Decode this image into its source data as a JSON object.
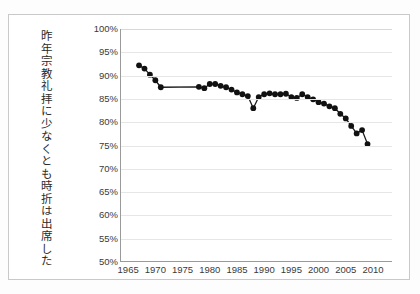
{
  "chart_data": {
    "type": "line",
    "title": "",
    "subtitle": "",
    "xlabel": "",
    "ylabel": "昨年宗教礼拝に少なくとも時折は出席した",
    "xlim": [
      1963.5,
      2013.5
    ],
    "ylim": [
      50,
      100
    ],
    "grid": true,
    "legend": false,
    "marker": "filled-circle",
    "line_color": "#1a1a1a",
    "marker_color": "#111111",
    "ytick_labels": [
      "100%",
      "95%",
      "90%",
      "85%",
      "80%",
      "75%",
      "70%",
      "65%",
      "60%",
      "55%",
      "50%"
    ],
    "ytick_values": [
      100,
      95,
      90,
      85,
      80,
      75,
      70,
      65,
      60,
      55,
      50
    ],
    "xtick_labels": [
      "1965",
      "1970",
      "1975",
      "1980",
      "1985",
      "1990",
      "1995",
      "2000",
      "2005",
      "2010"
    ],
    "xtick_values": [
      1965,
      1970,
      1975,
      1980,
      1985,
      1990,
      1995,
      2000,
      2005,
      2010
    ],
    "series": [
      {
        "name": "昨年宗教礼拝に少なくとも時折は出席した",
        "x": [
          1967,
          1968,
          1969,
          1970,
          1971,
          1978,
          1979,
          1980,
          1981,
          1982,
          1983,
          1984,
          1985,
          1986,
          1987,
          1988,
          1989,
          1990,
          1991,
          1992,
          1993,
          1994,
          1995,
          1996,
          1997,
          1998,
          1999,
          2000,
          2001,
          2002,
          2003,
          2004,
          2005,
          2006,
          2007,
          2008,
          2009
        ],
        "y": [
          92.2,
          91.5,
          90.2,
          89.0,
          87.5,
          87.6,
          87.3,
          88.2,
          88.2,
          87.8,
          87.5,
          87.0,
          86.4,
          86.0,
          85.6,
          83.0,
          85.4,
          86.0,
          86.2,
          86.0,
          86.0,
          86.1,
          85.4,
          85.2,
          86.0,
          85.4,
          84.9,
          84.3,
          84.0,
          83.4,
          83.0,
          81.8,
          80.8,
          79.2,
          77.6,
          78.3,
          75.3
        ]
      }
    ]
  },
  "frame": {
    "border_color": "#c9c9c9",
    "background": "#ffffff"
  }
}
